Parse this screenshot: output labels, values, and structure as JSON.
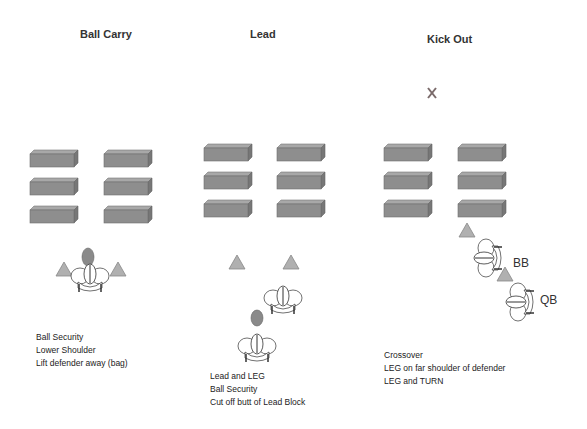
{
  "panels": [
    {
      "title": "Ball Carry",
      "notes": [
        "Ball Security",
        "Lower Shoulder",
        "Lift defender away (bag)"
      ]
    },
    {
      "title": "Lead",
      "notes": [
        "Lead and LEG",
        "Ball Security",
        "Cut off butt of Lead Block"
      ]
    },
    {
      "title": "Kick Out",
      "notes": [
        "Crossover",
        "LEG on far shoulder of defender",
        "LEG and TURN"
      ],
      "labels": {
        "bb": "BB",
        "qb": "QB"
      }
    }
  ],
  "colors": {
    "bag": "#8e8e8e",
    "bag_edge": "#6f6f6f",
    "cone": "#b0b0b0",
    "ball": "#8a8a8a",
    "marker": "#7a6a6a"
  },
  "icons": [
    "tackling-dummy-icon",
    "blocking-bag-icon",
    "cone-icon",
    "football-icon",
    "player-icon",
    "x-mark-icon"
  ]
}
